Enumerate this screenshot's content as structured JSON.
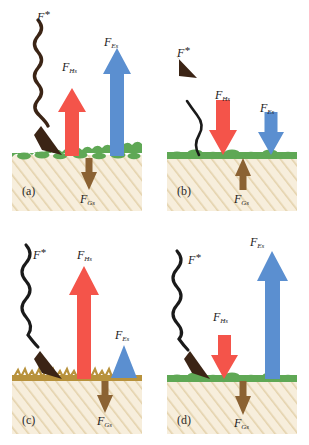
{
  "figure": {
    "background": "#ffffff",
    "colors": {
      "sensible_heat_arrow": "#F4544A",
      "latent_heat_arrow": "#5B8FD0",
      "ground_heat_arrow": "#8B6233",
      "radiation_arrow": "#3B2415",
      "green_vegetation": "#5FA855",
      "dry_vegetation": "#B8923C",
      "soil_fill": "#F7EEDC",
      "soil_hatch": "#E2CFA8",
      "label_text": "#1a1a1a"
    }
  },
  "symbols": {
    "radiation": {
      "main": "F",
      "sup": "*"
    },
    "sensible": {
      "main": "F",
      "sub": "Hs"
    },
    "latent": {
      "main": "F",
      "sub": "Es"
    },
    "ground": {
      "main": "F",
      "sub": "Gs"
    }
  },
  "panels": [
    {
      "id": "a",
      "letter": "(a)",
      "surface": "green-vegetation",
      "fluxes": [
        {
          "name": "radiation",
          "label_main": "F",
          "label_sup": "*",
          "direction": "down",
          "style": "wavy",
          "color": "#3B2415",
          "magnitude": "large"
        },
        {
          "name": "sensible",
          "label_main": "F",
          "label_sub": "Hs",
          "direction": "up",
          "style": "straight",
          "color": "#F4544A",
          "magnitude": "large"
        },
        {
          "name": "latent",
          "label_main": "F",
          "label_sub": "Es",
          "direction": "up",
          "style": "straight",
          "color": "#5B8FD0",
          "magnitude": "very-large"
        },
        {
          "name": "ground",
          "label_main": "F",
          "label_sub": "Gs",
          "direction": "down",
          "style": "straight",
          "color": "#8B6233",
          "magnitude": "small"
        }
      ]
    },
    {
      "id": "b",
      "letter": "(b)",
      "surface": "green-vegetation",
      "fluxes": [
        {
          "name": "radiation",
          "label_main": "F",
          "label_sup": "*",
          "direction": "up",
          "style": "wavy",
          "color": "#3B2415",
          "magnitude": "medium"
        },
        {
          "name": "sensible",
          "label_main": "F",
          "label_sub": "Hs",
          "direction": "down",
          "style": "straight",
          "color": "#F4544A",
          "magnitude": "medium"
        },
        {
          "name": "latent",
          "label_main": "F",
          "label_sub": "Es",
          "direction": "down",
          "style": "straight",
          "color": "#5B8FD0",
          "magnitude": "medium"
        },
        {
          "name": "ground",
          "label_main": "F",
          "label_sub": "Gs",
          "direction": "up",
          "style": "straight",
          "color": "#8B6233",
          "magnitude": "small"
        }
      ]
    },
    {
      "id": "c",
      "letter": "(c)",
      "surface": "dry-vegetation",
      "fluxes": [
        {
          "name": "radiation",
          "label_main": "F",
          "label_sup": "*",
          "direction": "down",
          "style": "wavy",
          "color": "#3B2415",
          "magnitude": "large"
        },
        {
          "name": "sensible",
          "label_main": "F",
          "label_sub": "Hs",
          "direction": "up",
          "style": "straight",
          "color": "#F4544A",
          "magnitude": "very-large"
        },
        {
          "name": "latent",
          "label_main": "F",
          "label_sub": "Es",
          "direction": "up",
          "style": "straight",
          "color": "#5B8FD0",
          "magnitude": "small"
        },
        {
          "name": "ground",
          "label_main": "F",
          "label_sub": "Gs",
          "direction": "down",
          "style": "straight",
          "color": "#8B6233",
          "magnitude": "small"
        }
      ]
    },
    {
      "id": "d",
      "letter": "(d)",
      "surface": "green-vegetation",
      "fluxes": [
        {
          "name": "radiation",
          "label_main": "F",
          "label_sup": "*",
          "direction": "down",
          "style": "wavy",
          "color": "#3B2415",
          "magnitude": "large"
        },
        {
          "name": "sensible",
          "label_main": "F",
          "label_sub": "Hs",
          "direction": "down",
          "style": "straight",
          "color": "#F4544A",
          "magnitude": "small"
        },
        {
          "name": "latent",
          "label_main": "F",
          "label_sub": "Es",
          "direction": "up",
          "style": "straight",
          "color": "#5B8FD0",
          "magnitude": "very-large"
        },
        {
          "name": "ground",
          "label_main": "F",
          "label_sub": "Gs",
          "direction": "down",
          "style": "straight",
          "color": "#8B6233",
          "magnitude": "small"
        }
      ]
    }
  ]
}
